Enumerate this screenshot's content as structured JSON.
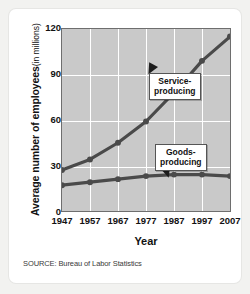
{
  "chart_data": {
    "type": "line",
    "title": "",
    "xlabel": "Year",
    "ylabel": "Average number of employees",
    "ylabel_unit": "(in millions)",
    "x": [
      1947,
      1957,
      1967,
      1977,
      1987,
      1997,
      2007
    ],
    "xticklabels": [
      "1947",
      "1957",
      "1967",
      "1977",
      "1987",
      "1997",
      "2007"
    ],
    "yticklabels": [
      "0",
      "30",
      "60",
      "90",
      "120"
    ],
    "yticks": [
      0,
      30,
      60,
      90,
      120
    ],
    "ylim": [
      0,
      120
    ],
    "xlim": [
      1947,
      2007
    ],
    "grid": true,
    "legend": "annotations",
    "series": [
      {
        "name": "Service-producing",
        "values": [
          27,
          34,
          45,
          59,
          78,
          99,
          115
        ],
        "color": "#4a4a4a"
      },
      {
        "name": "Goods-producing",
        "values": [
          17,
          19,
          21,
          23,
          24,
          24,
          23
        ],
        "color": "#4a4a4a"
      }
    ],
    "annotations": [
      {
        "label": "Service-producing",
        "line1": "Service-",
        "line2": "producing"
      },
      {
        "label": "Goods-producing",
        "line1": "Goods-",
        "line2": "producing"
      }
    ],
    "source": "SOURCE: Bureau of Labor Statistics",
    "plot_background": "#c9c9c9",
    "grid_color": "#ffffff",
    "axis_color": "#6e6e6e",
    "text_color": "#121212"
  }
}
